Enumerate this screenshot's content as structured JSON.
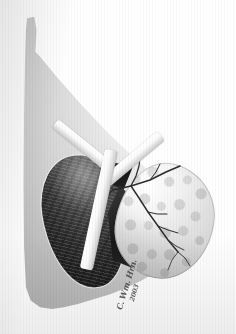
{
  "figure": {
    "medium": "grayscale halftone print / airbrush rendering",
    "canvas": {
      "width_px": 236,
      "height_px": 334,
      "background_color": "#ffffff"
    }
  },
  "structures": {
    "background_mass": {
      "name": "background-organ-mass",
      "description": "large pale gray organ mass with pointed superior process and vertical scan-line texture",
      "fill_light": "#f2f2f2",
      "fill_mid": "#d7d7d7",
      "fill_dark": "#a9a9a9"
    },
    "dark_organ": {
      "name": "dark-striated-organ",
      "description": "dark oval organ with radiating striations, left lower field",
      "fill_light": "#6b6b6b",
      "fill_dark": "#1b1b1b",
      "outline_color": "#ffffff"
    },
    "nodular_organ": {
      "name": "light-nodular-organ",
      "description": "pale lobulated organ with cobblestone nodules, right lower field",
      "fill_light": "#ffffff",
      "fill_dark": "#cfcfcf",
      "nodule_shadow": "#000000"
    },
    "hilar_wedge": {
      "name": "dark-hilar-wedge",
      "description": "dark triangular cut surface between the two organs",
      "fill_light": "#3a3a3a",
      "fill_dark": "#171717"
    },
    "vessel_tree": {
      "name": "branching-vessel-tree",
      "description": "dark branching vascular tree over the nodular organ",
      "stroke_color": "#2b2b2b",
      "branch_count": 11
    },
    "retractor_bands": [
      {
        "name": "band-upper-left",
        "orientation": "diagonal-down-right",
        "fill": "#ffffff"
      },
      {
        "name": "band-upper-right",
        "orientation": "diagonal-up-right",
        "fill": "#ffffff"
      },
      {
        "name": "band-vertical",
        "orientation": "vertical",
        "fill": "#ffffff"
      }
    ]
  },
  "signature": {
    "name_mark": "C. Wm. Hrn.",
    "year_mark": "2003"
  }
}
